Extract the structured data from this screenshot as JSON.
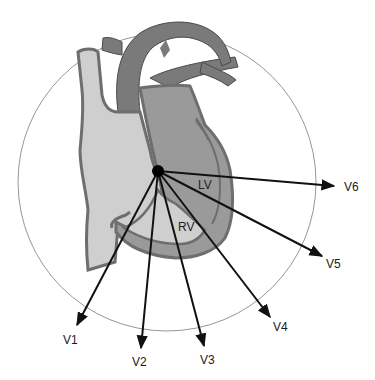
{
  "diagram": {
    "center": {
      "x": 158,
      "y": 171
    },
    "circle": {
      "cx": 167,
      "cy": 182,
      "r": 149,
      "color": "#8a8a8a"
    },
    "colors": {
      "wall": "#6e6e6e",
      "left_heart": "#9a9a9a",
      "right_heart": "#cfcfcf",
      "vessel": "#7a7a7a",
      "outline": "#4a4a4a",
      "arrow": "#111111"
    },
    "chambers": [
      {
        "label": "LV",
        "x": 198,
        "y": 189
      },
      {
        "label": "RV",
        "x": 178,
        "y": 231
      }
    ],
    "leads": [
      {
        "label": "V1",
        "tip": {
          "x": 77,
          "y": 325
        },
        "label_pos": {
          "x": 63,
          "y": 344
        }
      },
      {
        "label": "V2",
        "tip": {
          "x": 141,
          "y": 348
        },
        "label_pos": {
          "x": 132,
          "y": 366
        }
      },
      {
        "label": "V3",
        "tip": {
          "x": 204,
          "y": 346
        },
        "label_pos": {
          "x": 200,
          "y": 364
        }
      },
      {
        "label": "V4",
        "tip": {
          "x": 270,
          "y": 317
        },
        "label_pos": {
          "x": 273,
          "y": 331
        }
      },
      {
        "label": "V5",
        "tip": {
          "x": 322,
          "y": 256
        },
        "label_pos": {
          "x": 326,
          "y": 268
        }
      },
      {
        "label": "V6",
        "tip": {
          "x": 334,
          "y": 186
        },
        "label_pos": {
          "x": 344,
          "y": 191
        }
      }
    ]
  }
}
